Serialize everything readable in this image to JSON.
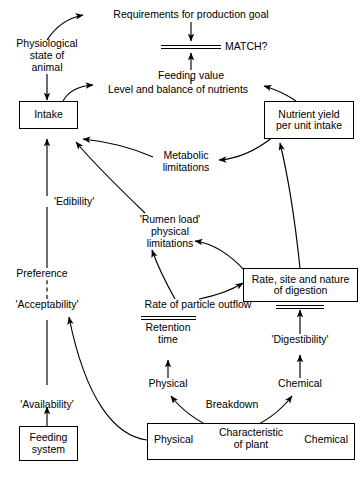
{
  "diagram": {
    "colors": {
      "ink": "#000000",
      "paper": "#ffffff"
    },
    "nodes": {
      "requirements": {
        "label": "Requirements for production  goal"
      },
      "match": {
        "label": "MATCH?",
        "symbol": "double-line-balance"
      },
      "physiological": {
        "line1": "Physiological",
        "line2": "state of",
        "line3": "animal"
      },
      "feeding_value": {
        "label": "Feeding value"
      },
      "level_balance": {
        "label": "Level and balance of nutrients"
      },
      "intake": {
        "label": "Intake",
        "boxed": true
      },
      "nutrient_yield": {
        "line1": "Nutrient yield",
        "line2": "per unit intake",
        "boxed": true
      },
      "metabolic": {
        "line1": "Metabolic",
        "line2": "limitations"
      },
      "edibility": {
        "label": "'Edibility'"
      },
      "rumen_load": {
        "line1": "'Rumen load'",
        "line2": "physical",
        "line3": "limitations"
      },
      "preference": {
        "label": "Preference"
      },
      "acceptability": {
        "label": "'Acceptability'"
      },
      "rate_site": {
        "line1": "Rate, site and nature",
        "line2": "of digestion",
        "boxed": true
      },
      "particle_outflow": {
        "label": "Rate of particle outflow"
      },
      "retention": {
        "line1": "Retention",
        "line2": "time"
      },
      "digestibility": {
        "label": "'Digestibility'"
      },
      "physical_mid": {
        "label": "Physical"
      },
      "chemical_mid": {
        "label": "Chemical"
      },
      "breakdown": {
        "label": "Breakdown"
      },
      "availability": {
        "label": "'Availability'"
      },
      "feeding_system": {
        "line1": "Feeding",
        "line2": "system",
        "boxed": true
      },
      "plant_box": {
        "left": "Physical",
        "center_line1": "Characteristic",
        "center_line2": "of plant",
        "right": "Chemical",
        "boxed": true
      }
    }
  }
}
